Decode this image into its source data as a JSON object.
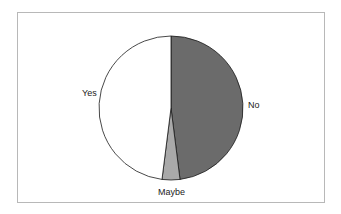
{
  "chart_data": {
    "type": "pie",
    "title": "",
    "categories": [
      "No",
      "Maybe",
      "Yes"
    ],
    "values": [
      48,
      4,
      48
    ],
    "colors": [
      "#6b6b6b",
      "#a9a9a9",
      "#ffffff"
    ],
    "start_angle_deg": 0,
    "direction": "clockwise",
    "legend": "none",
    "data_labels": "category names outside"
  },
  "labels": {
    "no": "No",
    "maybe": "Maybe",
    "yes": "Yes"
  }
}
